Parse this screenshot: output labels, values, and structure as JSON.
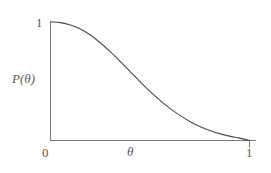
{
  "figure": {
    "name": "probability-decay-plot",
    "background_color": "#ffffff",
    "axis_color": "#7a7a7a",
    "curve_color": "#4a4a4a",
    "text_color": "#5a5a5a"
  },
  "chart_data": {
    "type": "line",
    "title": "",
    "subtitle": "",
    "xlabel": "θ",
    "ylabel": "P(θ)",
    "xlim": [
      0,
      1
    ],
    "ylim": [
      0,
      1
    ],
    "xticks": [
      0,
      1
    ],
    "xticklabels": [
      "0",
      "1"
    ],
    "yticks": [
      1
    ],
    "yticklabels": [
      "1"
    ],
    "grid": false,
    "legend": null,
    "annotations": [],
    "series": [
      {
        "name": "P(θ)",
        "x": [
          0.0,
          0.05,
          0.1,
          0.15,
          0.2,
          0.25,
          0.3,
          0.35,
          0.4,
          0.45,
          0.5,
          0.55,
          0.6,
          0.65,
          0.7,
          0.75,
          0.8,
          0.85,
          0.9,
          0.95,
          1.0
        ],
        "y": [
          1.0,
          0.995,
          0.975,
          0.94,
          0.89,
          0.825,
          0.75,
          0.668,
          0.582,
          0.497,
          0.415,
          0.339,
          0.271,
          0.212,
          0.161,
          0.119,
          0.085,
          0.058,
          0.037,
          0.02,
          0.0
        ]
      }
    ]
  },
  "labels": {
    "y_tick_one": "1",
    "x_tick_zero": "0",
    "x_tick_one": "1",
    "y_axis_title": "P(θ)",
    "x_axis_title": "θ"
  }
}
